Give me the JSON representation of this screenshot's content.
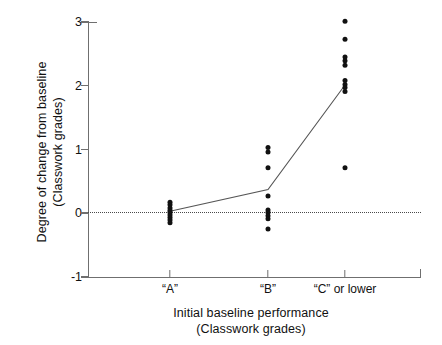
{
  "chart_data": {
    "type": "scatter",
    "title": "",
    "xlabel": "Initial baseline performance\n(Classwork grades)",
    "ylabel": "Degree of change from baseline\n(Classwork grades)",
    "categories": [
      "“A”",
      "“B”",
      "“C” or lower"
    ],
    "ylim": [
      -1,
      3
    ],
    "yticks": [
      3,
      2,
      1,
      0,
      -1
    ],
    "ytick_labels": [
      "3",
      "2",
      "1",
      "0",
      "-1"
    ],
    "grid": false,
    "legend": null,
    "reference_line": {
      "y": 0,
      "style": "dotted"
    },
    "series": [
      {
        "name": "Individual participants",
        "marker": "filled-circle",
        "points": [
          {
            "category": "“A”",
            "values": [
              0.16,
              0.12,
              0.07,
              0.03,
              0.0,
              -0.04,
              -0.08,
              -0.12,
              -0.16
            ]
          },
          {
            "category": "“B”",
            "values": [
              1.02,
              0.95,
              0.7,
              0.26,
              0.04,
              0.0,
              -0.05,
              -0.1,
              -0.26
            ]
          },
          {
            "category": "“C” or lower",
            "values": [
              3.0,
              2.72,
              2.44,
              2.38,
              2.31,
              2.07,
              2.01,
              1.96,
              1.9,
              0.7
            ]
          }
        ]
      },
      {
        "name": "Group mean",
        "marker": "line",
        "categories": [
          "“A”",
          "“B”",
          "“C” or lower"
        ],
        "values": [
          0.02,
          0.36,
          2.0
        ]
      }
    ]
  },
  "axes": {
    "y_title": "Degree of change from baseline\n(Classwork grades)",
    "x_title": "Initial baseline performance\n(Classwork grades)",
    "y_tick_labels": [
      "3",
      "2",
      "1",
      "0",
      "-1"
    ],
    "x_tick_labels": [
      "“A”",
      "“B”",
      "“C” or lower"
    ]
  },
  "colors": {
    "marker": "#111111",
    "mean_line": "#555555",
    "axis": "#6f6f6f",
    "reference_line": "#4a4a4a",
    "background": "#ffffff",
    "text": "#111111"
  }
}
